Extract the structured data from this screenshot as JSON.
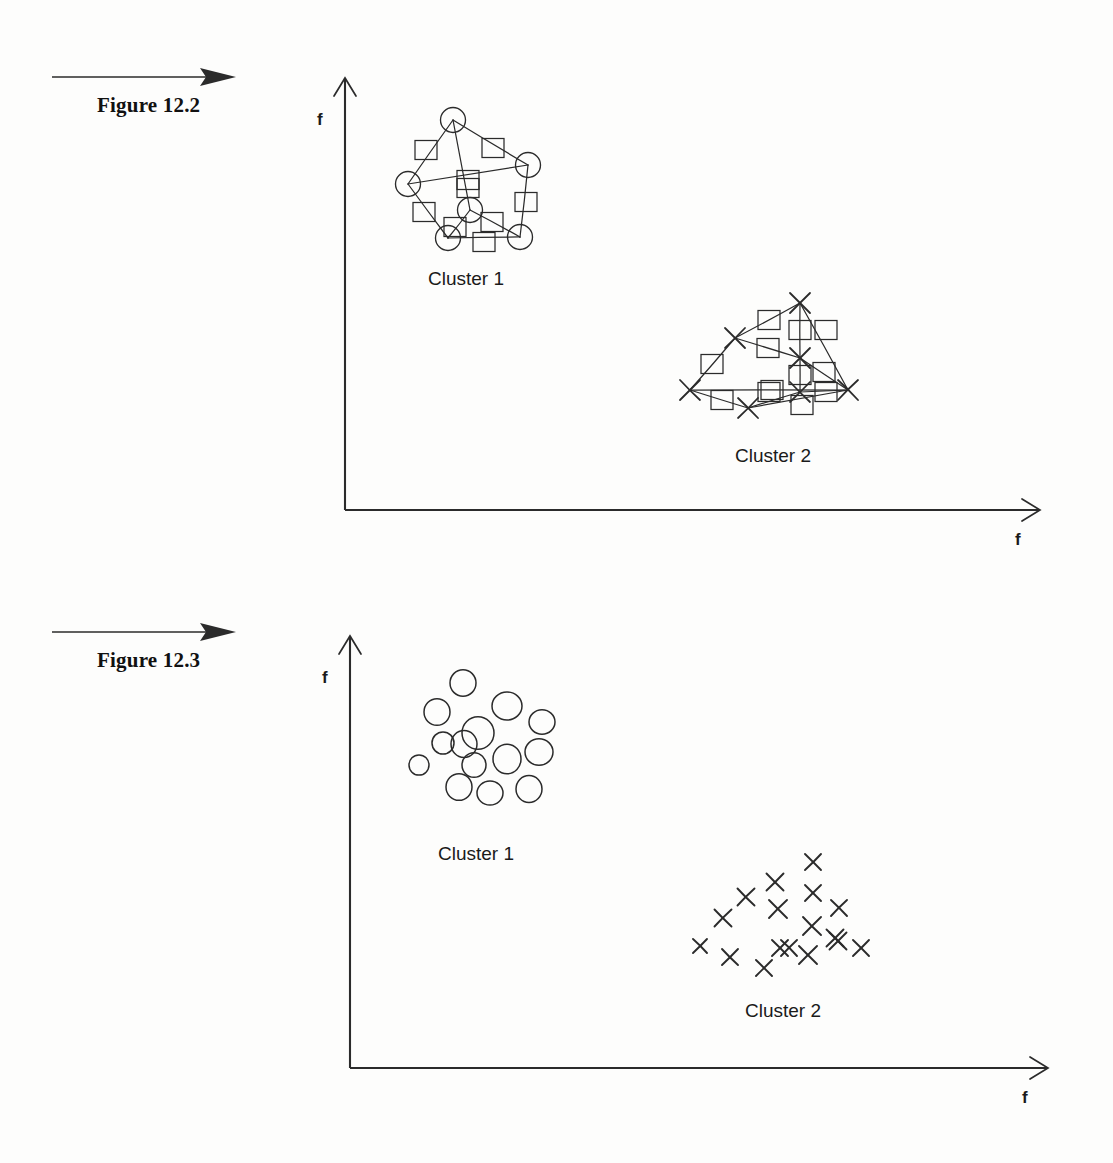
{
  "document": {
    "page_background": "#fdfdfc",
    "ink_color": "#2b2b2b"
  },
  "figures": [
    {
      "id": "figure-12-2",
      "caption": "Figure 12.2",
      "axis": {
        "y_label": "f",
        "x_label": "f",
        "origin": [
          345,
          510
        ],
        "y_top": [
          345,
          78
        ],
        "x_right": [
          1040,
          510
        ]
      },
      "clusters": [
        {
          "label": "Cluster 1",
          "label_pos": [
            428,
            268
          ],
          "marker": "circle"
        },
        {
          "label": "Cluster 2",
          "label_pos": [
            735,
            445
          ],
          "marker": "cross"
        }
      ]
    },
    {
      "id": "figure-12-3",
      "caption": "Figure 12.3",
      "axis": {
        "y_label": "f",
        "x_label": "f",
        "origin": [
          350,
          1068
        ],
        "y_top": [
          350,
          636
        ],
        "x_right": [
          1048,
          1068
        ]
      },
      "clusters": [
        {
          "label": "Cluster 1",
          "label_pos": [
            438,
            843
          ],
          "marker": "circle"
        },
        {
          "label": "Cluster 2",
          "label_pos": [
            745,
            1000
          ],
          "marker": "cross"
        }
      ]
    }
  ],
  "chart_data": [
    {
      "type": "scatter",
      "title": "Figure 12.2",
      "xlabel": "f",
      "ylabel": "f",
      "description": "Two clusters shown as graphs: nodes connected by edges with square link-weight boxes on each edge.",
      "grid": false,
      "legend": false,
      "series": [
        {
          "name": "Cluster 1",
          "marker": "circle",
          "label_position": [
            428,
            268
          ],
          "nodes": [
            [
              453,
              120
            ],
            [
              408,
              184
            ],
            [
              528,
              165
            ],
            [
              470,
              210
            ],
            [
              448,
              238
            ],
            [
              520,
              237
            ]
          ],
          "edges": [
            [
              0,
              1
            ],
            [
              0,
              2
            ],
            [
              0,
              3
            ],
            [
              1,
              2
            ],
            [
              1,
              4
            ],
            [
              2,
              5
            ],
            [
              3,
              4
            ],
            [
              3,
              5
            ],
            [
              4,
              5
            ]
          ],
          "edge_boxes": [
            [
              426,
              150
            ],
            [
              493,
              148
            ],
            [
              468,
              180
            ],
            [
              468,
              188
            ],
            [
              424,
              212
            ],
            [
              526,
              202
            ],
            [
              455,
              227
            ],
            [
              492,
              222
            ],
            [
              484,
              242
            ]
          ]
        },
        {
          "name": "Cluster 2",
          "marker": "cross",
          "label_position": [
            735,
            445
          ],
          "nodes": [
            [
              800,
              303
            ],
            [
              735,
              338
            ],
            [
              690,
              390
            ],
            [
              800,
              358
            ],
            [
              848,
              390
            ],
            [
              748,
              408
            ],
            [
              800,
              392
            ]
          ],
          "edges": [
            [
              0,
              1
            ],
            [
              0,
              3
            ],
            [
              0,
              4
            ],
            [
              1,
              2
            ],
            [
              1,
              3
            ],
            [
              2,
              4
            ],
            [
              2,
              5
            ],
            [
              3,
              4
            ],
            [
              3,
              6
            ],
            [
              5,
              6
            ],
            [
              5,
              4
            ],
            [
              6,
              4
            ]
          ],
          "edge_boxes": [
            [
              769,
              320
            ],
            [
              800,
              330
            ],
            [
              826,
              330
            ],
            [
              712,
              364
            ],
            [
              768,
              348
            ],
            [
              769,
              392
            ],
            [
              722,
              400
            ],
            [
              824,
              372
            ],
            [
              800,
              375
            ],
            [
              772,
              390
            ],
            [
              802,
              405
            ],
            [
              826,
              392
            ]
          ]
        }
      ]
    },
    {
      "type": "scatter",
      "title": "Figure 12.3",
      "xlabel": "f",
      "ylabel": "f",
      "description": "Two unconnected point clouds: one of hollow circles, one of small crosses.",
      "grid": false,
      "legend": false,
      "series": [
        {
          "name": "Cluster 1",
          "marker": "circle",
          "label_position": [
            438,
            843
          ],
          "points": [
            [
              463,
              683
            ],
            [
              437,
              712
            ],
            [
              507,
              706
            ],
            [
              478,
              733
            ],
            [
              542,
              722
            ],
            [
              443,
              743
            ],
            [
              539,
              752
            ],
            [
              474,
              765
            ],
            [
              507,
              759
            ],
            [
              419,
              765
            ],
            [
              459,
              787
            ],
            [
              490,
              793
            ],
            [
              529,
              789
            ],
            [
              464,
              744
            ]
          ],
          "radii": [
            13,
            13,
            15,
            16,
            13,
            11,
            14,
            12,
            14,
            10,
            13,
            13,
            13,
            13
          ]
        },
        {
          "name": "Cluster 2",
          "marker": "cross",
          "label_position": [
            745,
            1000
          ],
          "points": [
            [
              813,
              862
            ],
            [
              775,
              882
            ],
            [
              813,
              893
            ],
            [
              746,
              897
            ],
            [
              778,
              909
            ],
            [
              839,
              908
            ],
            [
              812,
              926
            ],
            [
              723,
              918
            ],
            [
              835,
              938
            ],
            [
              700,
              946
            ],
            [
              780,
              948
            ],
            [
              789,
              948
            ],
            [
              838,
              941
            ],
            [
              861,
              948
            ],
            [
              730,
              957
            ],
            [
              764,
              968
            ],
            [
              808,
              955
            ]
          ],
          "sizes": [
            11,
            12,
            11,
            12,
            13,
            11,
            13,
            12,
            12,
            9,
            11,
            11,
            12,
            11,
            11,
            11,
            13
          ]
        }
      ]
    }
  ]
}
